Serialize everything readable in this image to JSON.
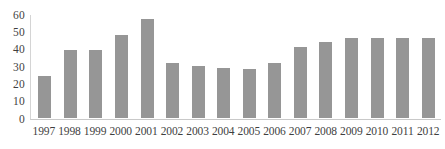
{
  "chart_data": {
    "type": "bar",
    "title": "",
    "subtitle": "",
    "xlabel": "",
    "ylabel": "",
    "categories": [
      "1997",
      "1998",
      "1999",
      "2000",
      "2001",
      "2002",
      "2003",
      "2004",
      "2005",
      "2006",
      "2007",
      "2008",
      "2009",
      "2010",
      "2011",
      "2012"
    ],
    "values": [
      24,
      39,
      39,
      48,
      57,
      32,
      30,
      29,
      28,
      32,
      41,
      44,
      46,
      46,
      46,
      46
    ],
    "series": [
      {
        "name": "",
        "values": [
          24,
          39,
          39,
          48,
          57,
          32,
          30,
          29,
          28,
          32,
          41,
          44,
          46,
          46,
          46,
          46
        ]
      }
    ],
    "ylim": [
      0,
      60
    ],
    "yticks": [
      0,
      10,
      20,
      30,
      40,
      50,
      60
    ],
    "ytick_labels": [
      "0",
      "10",
      "20",
      "30",
      "40",
      "50",
      "60"
    ],
    "xtick_labels": [
      "1997",
      "1998",
      "1999",
      "2000",
      "2001",
      "2002",
      "2003",
      "2004",
      "2005",
      "2006",
      "2007",
      "2008",
      "2009",
      "2010",
      "2011",
      "2012"
    ],
    "grid": false,
    "legend": false,
    "legend_position": "none",
    "annotations": [],
    "colors": {
      "bar": "#969696",
      "axis": "#c9c9c9",
      "text": "#3f3f3f",
      "background": "#ffffff"
    }
  }
}
